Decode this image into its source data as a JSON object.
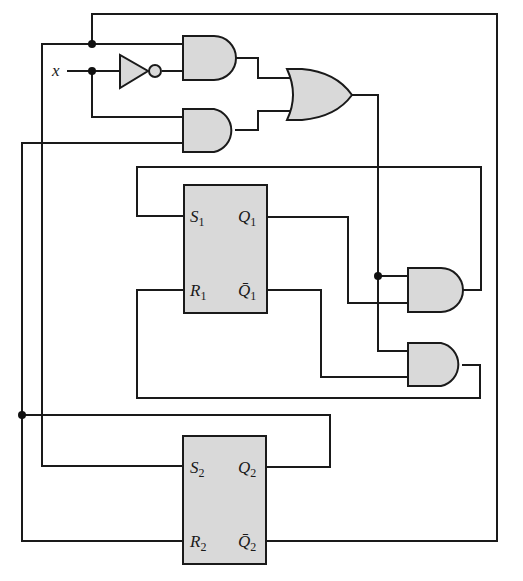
{
  "diagram": {
    "type": "sequential-logic-circuit",
    "input": {
      "label": "x"
    },
    "gates": [
      {
        "id": "not1",
        "type": "NOT"
      },
      {
        "id": "and_top",
        "type": "AND"
      },
      {
        "id": "and_bottom",
        "type": "AND"
      },
      {
        "id": "or1",
        "type": "OR"
      },
      {
        "id": "and_s1",
        "type": "AND"
      },
      {
        "id": "and_r1",
        "type": "AND"
      }
    ],
    "flipflops": [
      {
        "id": "ff1",
        "type": "SR",
        "inputs": [
          {
            "letter": "S",
            "sub": "1"
          },
          {
            "letter": "R",
            "sub": "1"
          }
        ],
        "outputs": [
          {
            "letter": "Q",
            "sub": "1"
          },
          {
            "letter": "Q̄",
            "sub": "1"
          }
        ]
      },
      {
        "id": "ff2",
        "type": "SR",
        "inputs": [
          {
            "letter": "S",
            "sub": "2"
          },
          {
            "letter": "R",
            "sub": "2"
          }
        ],
        "outputs": [
          {
            "letter": "Q",
            "sub": "2"
          },
          {
            "letter": "Q̄",
            "sub": "2"
          }
        ]
      }
    ],
    "colors": {
      "gate_fill": "#d9d9d9",
      "wire": "#1a1a1a",
      "background": "#ffffff"
    }
  }
}
